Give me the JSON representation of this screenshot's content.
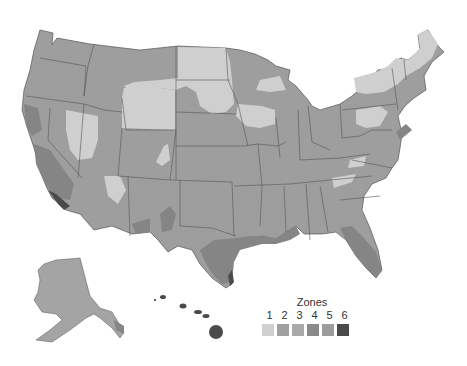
{
  "map": {
    "title": "Climate zones of the United States",
    "legend": {
      "title": "Zones",
      "items": [
        {
          "zone": "1",
          "color": "#cfcfcf"
        },
        {
          "zone": "2",
          "color": "#a0a0a0"
        },
        {
          "zone": "3",
          "color": "#a9a9a9"
        },
        {
          "zone": "4",
          "color": "#8a8a8a"
        },
        {
          "zone": "5",
          "color": "#9c9c9c"
        },
        {
          "zone": "6",
          "color": "#4a4a4a"
        }
      ]
    },
    "colors": {
      "base": "#9e9e9e",
      "light": "#cfcfcf",
      "dark": "#858585",
      "darkest": "#4a4a4a",
      "border": "#555555"
    }
  }
}
